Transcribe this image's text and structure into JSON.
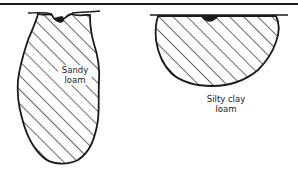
{
  "diagram": {
    "type": "soil-wetting-profiles",
    "profiles": [
      {
        "id": "left",
        "label_line1": "Sandy",
        "label_line2": "loam",
        "shape": "narrow-deep"
      },
      {
        "id": "right",
        "label_line1": "Silty clay",
        "label_line2": "loam",
        "shape": "wide-shallow"
      }
    ],
    "colors": {
      "ink": "#1a1a1a",
      "background": "#ffffff"
    }
  }
}
